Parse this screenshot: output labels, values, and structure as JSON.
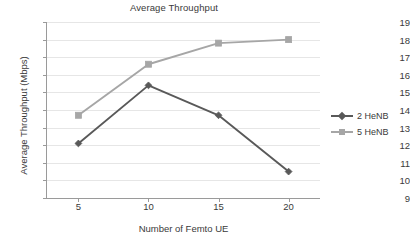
{
  "chart_data": {
    "type": "line",
    "title": "Average Throughput",
    "xlabel": "Number of Femto UE",
    "ylabel": "Average  Throughput (Mbps)",
    "categories": [
      5,
      10,
      15,
      20
    ],
    "x": [
      5,
      10,
      15,
      20
    ],
    "xtick_labels": [
      "5",
      "10",
      "15",
      "20"
    ],
    "ytick_labels": [
      "19",
      "18",
      "17",
      "16",
      "15",
      "14",
      "13",
      "12",
      "11",
      "10",
      "9"
    ],
    "ylim": [
      9,
      19
    ],
    "ytick_step": 1,
    "grid": "horizontal",
    "legend_position": "right",
    "series": [
      {
        "name": "2 HeNB",
        "color": "#595959",
        "marker": "diamond",
        "values": [
          12.1,
          15.4,
          13.7,
          10.5
        ]
      },
      {
        "name": "5 HeNB",
        "color": "#a6a6a6",
        "marker": "square",
        "values": [
          13.7,
          16.6,
          17.8,
          18.0
        ]
      }
    ]
  },
  "legend": {
    "items": [
      {
        "label": "2 HeNB"
      },
      {
        "label": "5 HeNB"
      }
    ]
  },
  "colors": {
    "series_2henb": "#595959",
    "series_5henb": "#a6a6a6",
    "gridline": "#e6e6e6",
    "axis": "#9a9a9a",
    "text": "#3a3a3a",
    "background": "#ffffff"
  }
}
